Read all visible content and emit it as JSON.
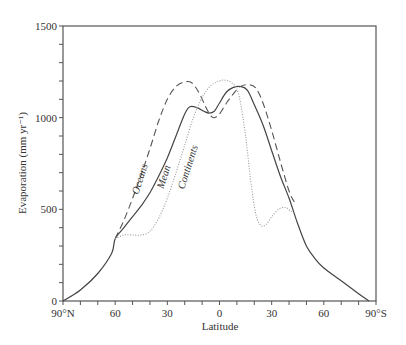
{
  "chart_data": {
    "type": "line",
    "title": "",
    "xlabel": "Latitude",
    "ylabel": "Evaporation (mm yr⁻¹)",
    "ylim": [
      0,
      1500
    ],
    "xlim": [
      -90,
      90
    ],
    "x_note": "x expressed as degrees from 90°N (-90) to 90°S (+90); negative = north, positive = south",
    "x_tick_labels": [
      "90°N",
      "60",
      "30",
      "0",
      "30",
      "60",
      "90°S"
    ],
    "x_tick_values": [
      -90,
      -60,
      -30,
      0,
      30,
      60,
      90
    ],
    "y_tick_labels": [
      "0",
      "500",
      "1000",
      "1500"
    ],
    "y_tick_values": [
      0,
      500,
      1000,
      1500
    ],
    "y_minor_step": 100,
    "x_minor_step": 10,
    "grid": false,
    "legend": "inline curve labels",
    "series": [
      {
        "name": "Mean",
        "style": "solid",
        "points": [
          [
            -90,
            0
          ],
          [
            -80,
            60
          ],
          [
            -70,
            150
          ],
          [
            -62,
            260
          ],
          [
            -60,
            340
          ],
          [
            -55,
            400
          ],
          [
            -50,
            460
          ],
          [
            -45,
            520
          ],
          [
            -40,
            590
          ],
          [
            -35,
            680
          ],
          [
            -30,
            780
          ],
          [
            -25,
            900
          ],
          [
            -20,
            1020
          ],
          [
            -17,
            1060
          ],
          [
            -13,
            1055
          ],
          [
            -9,
            1035
          ],
          [
            -6,
            1025
          ],
          [
            -3,
            1035
          ],
          [
            0,
            1080
          ],
          [
            4,
            1140
          ],
          [
            8,
            1165
          ],
          [
            12,
            1170
          ],
          [
            16,
            1150
          ],
          [
            20,
            1070
          ],
          [
            25,
            960
          ],
          [
            30,
            820
          ],
          [
            35,
            680
          ],
          [
            40,
            560
          ],
          [
            45,
            420
          ],
          [
            50,
            300
          ],
          [
            55,
            230
          ],
          [
            60,
            180
          ],
          [
            70,
            110
          ],
          [
            80,
            40
          ],
          [
            86,
            0
          ]
        ]
      },
      {
        "name": "Oceans",
        "style": "dashed",
        "points": [
          [
            -60,
            340
          ],
          [
            -55,
            440
          ],
          [
            -50,
            560
          ],
          [
            -45,
            690
          ],
          [
            -40,
            830
          ],
          [
            -35,
            980
          ],
          [
            -30,
            1100
          ],
          [
            -25,
            1170
          ],
          [
            -20,
            1195
          ],
          [
            -16,
            1190
          ],
          [
            -12,
            1140
          ],
          [
            -8,
            1060
          ],
          [
            -5,
            1010
          ],
          [
            -3,
            1000
          ],
          [
            0,
            1020
          ],
          [
            4,
            1080
          ],
          [
            8,
            1130
          ],
          [
            12,
            1170
          ],
          [
            17,
            1180
          ],
          [
            21,
            1160
          ],
          [
            25,
            1080
          ],
          [
            30,
            930
          ],
          [
            35,
            760
          ],
          [
            40,
            600
          ],
          [
            43,
            540
          ]
        ]
      },
      {
        "name": "Continents",
        "style": "dotted",
        "points": [
          [
            -60,
            340
          ],
          [
            -55,
            360
          ],
          [
            -50,
            360
          ],
          [
            -45,
            360
          ],
          [
            -40,
            380
          ],
          [
            -35,
            450
          ],
          [
            -30,
            560
          ],
          [
            -25,
            700
          ],
          [
            -20,
            850
          ],
          [
            -15,
            1000
          ],
          [
            -10,
            1110
          ],
          [
            -5,
            1175
          ],
          [
            0,
            1200
          ],
          [
            3,
            1205
          ],
          [
            7,
            1190
          ],
          [
            11,
            1130
          ],
          [
            15,
            900
          ],
          [
            18,
            650
          ],
          [
            21,
            470
          ],
          [
            24,
            410
          ],
          [
            27,
            420
          ],
          [
            30,
            460
          ],
          [
            34,
            500
          ],
          [
            38,
            510
          ],
          [
            41,
            490
          ],
          [
            43,
            480
          ]
        ]
      }
    ],
    "annotations": [
      {
        "text": "Oceans",
        "near": [
          -44,
          700
        ],
        "rotation": -72
      },
      {
        "text": "Mean",
        "near": [
          -35,
          700
        ],
        "rotation": -72
      },
      {
        "text": "Continents",
        "near": [
          -16,
          770
        ],
        "rotation": -72
      }
    ]
  },
  "labels": {
    "xlabel": "Latitude",
    "ylabel": "Evaporation (mm yr⁻¹)",
    "oceans": "Oceans",
    "mean": "Mean",
    "continents": "Continents"
  }
}
